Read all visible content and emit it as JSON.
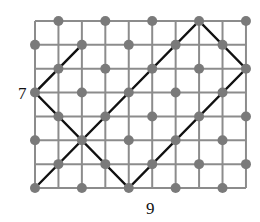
{
  "diagram": {
    "type": "grid-path",
    "grid": {
      "columns": 9,
      "rows": 7,
      "origin_x": 35,
      "origin_y": 21,
      "cell_w": 23.44,
      "cell_h": 23.86,
      "line_color": "#8c8c8c",
      "line_width": 2
    },
    "dots": {
      "rule": "intersections where (column + row) is odd",
      "color": "#7a7a7a",
      "radius": 5
    },
    "path": {
      "color": "#111111",
      "width": 2.4,
      "points": [
        [
          2,
          1
        ],
        [
          0,
          3
        ],
        [
          4,
          7
        ],
        [
          9,
          2
        ],
        [
          7,
          0
        ],
        [
          0,
          7
        ]
      ]
    },
    "labels": {
      "height": "7",
      "width": "9"
    }
  }
}
